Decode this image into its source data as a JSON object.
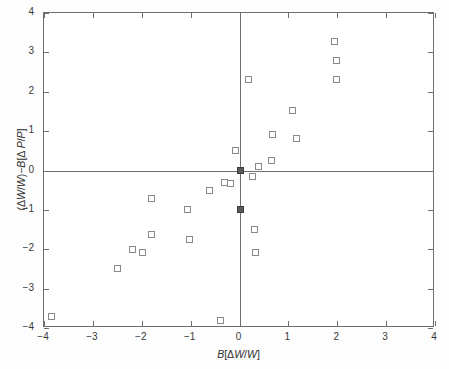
{
  "chart_data": {
    "type": "scatter",
    "title": "",
    "xlabel": "B[ΔW/W]",
    "ylabel": "(ΔW/W)−B[Δ P/P]",
    "xlim": [
      -4,
      4
    ],
    "ylim": [
      -4,
      4
    ],
    "xticks": [
      -4,
      -3,
      -2,
      -1,
      0,
      1,
      2,
      3,
      4
    ],
    "yticks": [
      -4,
      -3,
      -2,
      -1,
      0,
      1,
      2,
      3,
      4
    ],
    "xticklabels": [
      "-4",
      "-3",
      "-2",
      "-1",
      "0",
      "1",
      "2",
      "3",
      "4"
    ],
    "yticklabels": [
      "4",
      "3",
      "2",
      "1",
      "0",
      "-1",
      "-2",
      "-3",
      "-4"
    ],
    "grid": false,
    "legend": null,
    "zero_lines": {
      "horizontal": 0,
      "vertical": 0
    },
    "marker": "open-square",
    "series": [
      {
        "name": "observations",
        "marker": "open-square",
        "points": [
          [
            -3.85,
            -3.7
          ],
          [
            -2.5,
            -2.48
          ],
          [
            -2.2,
            -2.0
          ],
          [
            -2.0,
            -2.08
          ],
          [
            -1.82,
            -1.62
          ],
          [
            -1.82,
            -0.7
          ],
          [
            -1.08,
            -0.98
          ],
          [
            -1.03,
            -1.75
          ],
          [
            -0.62,
            -0.5
          ],
          [
            -0.4,
            -3.8
          ],
          [
            -0.32,
            -0.28
          ],
          [
            -0.2,
            -0.31
          ],
          [
            -0.1,
            0.51
          ],
          [
            0.18,
            2.32
          ],
          [
            0.25,
            -0.13
          ],
          [
            0.3,
            -1.49
          ],
          [
            0.32,
            -2.08
          ],
          [
            0.38,
            0.11
          ],
          [
            0.65,
            0.27
          ],
          [
            0.67,
            0.93
          ],
          [
            1.08,
            1.54
          ],
          [
            1.16,
            0.82
          ],
          [
            1.93,
            3.3
          ],
          [
            1.97,
            2.8
          ],
          [
            1.98,
            2.32
          ]
        ]
      },
      {
        "name": "highlighted",
        "marker": "filled-square",
        "points": [
          [
            0.0,
            0.02
          ],
          [
            0.0,
            -0.98
          ]
        ]
      }
    ]
  },
  "figure": {
    "background": "#ffffff",
    "frame_color": "#6e6e6e",
    "marker_color": "#8a8a8a",
    "text_color": "#3a3a3a"
  }
}
